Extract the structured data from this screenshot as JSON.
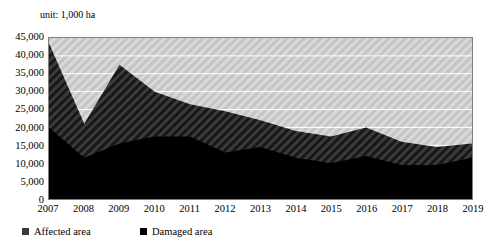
{
  "title": "",
  "unit_label": "unit: 1,000 ha",
  "legend": [
    {
      "label": "Affected area",
      "color": "#3a3a3a"
    },
    {
      "label": "Damaged area",
      "color": "#000000"
    }
  ],
  "colors": {
    "affected_band": "#d4d4d4",
    "affected_hatch": "#c0c0c0",
    "damaged_mid": "#2f2f2f",
    "damaged_hatch": "#1a1a1a",
    "damaged_area": "#000000",
    "gridline": "#ffffff",
    "plot_border": "#808080",
    "text": "#000000"
  },
  "chart_data": {
    "type": "area",
    "title": "",
    "xlabel": "",
    "ylabel": "unit: 1,000 ha",
    "ylim": [
      0,
      45000
    ],
    "ytick_step": 5000,
    "grid": true,
    "stacked": false,
    "legend_position": "bottom-left",
    "categories": [
      "2007",
      "2008",
      "2009",
      "2010",
      "2011",
      "2012",
      "2013",
      "2014",
      "2015",
      "2016",
      "2017",
      "2018",
      "2019"
    ],
    "ytick_labels": [
      "0",
      "5,000",
      "10,000",
      "15,000",
      "20,000",
      "25,000",
      "30,000",
      "35,000",
      "40,000",
      "45,000"
    ],
    "ytick_values": [
      0,
      5000,
      10000,
      15000,
      20000,
      25000,
      30000,
      35000,
      40000,
      45000
    ],
    "series": [
      {
        "name": "Affected area",
        "values": [
          43500,
          21000,
          37500,
          30000,
          26500,
          24500,
          22000,
          19000,
          17500,
          20000,
          16000,
          14500,
          15500
        ]
      },
      {
        "name": "Damaged area",
        "values": [
          20000,
          11500,
          15500,
          17500,
          17500,
          13000,
          14500,
          11500,
          10000,
          12000,
          9500,
          9500,
          11500
        ]
      }
    ]
  }
}
